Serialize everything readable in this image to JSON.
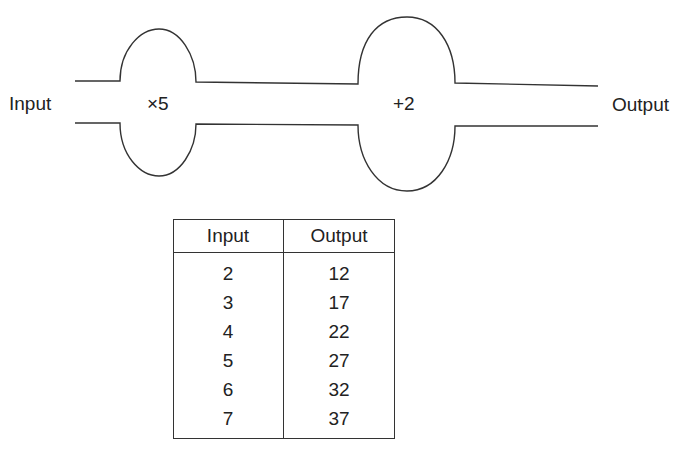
{
  "diagram": {
    "input_label": "Input",
    "output_label": "Output",
    "stages": [
      {
        "operation": "×5"
      },
      {
        "operation": "+2"
      }
    ]
  },
  "table": {
    "headers": [
      "Input",
      "Output"
    ],
    "rows": [
      [
        "2",
        "12"
      ],
      [
        "3",
        "17"
      ],
      [
        "4",
        "22"
      ],
      [
        "5",
        "27"
      ],
      [
        "6",
        "32"
      ],
      [
        "7",
        "37"
      ]
    ]
  }
}
